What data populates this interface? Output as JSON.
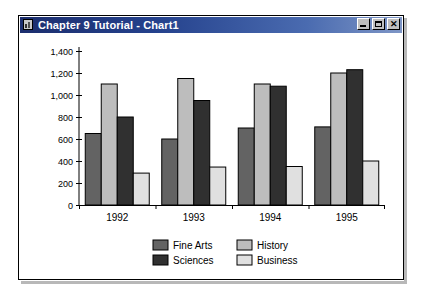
{
  "window": {
    "title": "Chapter 9 Tutorial - Chart1",
    "icon": "chart-document-icon",
    "buttons": {
      "minimize": "–",
      "maximize": "□",
      "close": "✕"
    }
  },
  "chart_data": {
    "type": "bar",
    "title": "",
    "xlabel": "",
    "ylabel": "",
    "categories": [
      "1992",
      "1993",
      "1994",
      "1995"
    ],
    "ylim": [
      0,
      1400
    ],
    "yticks": [
      0,
      200,
      400,
      600,
      800,
      1000,
      1200,
      1400
    ],
    "ytick_labels": [
      "0",
      "200",
      "400",
      "600",
      "800",
      "1,000",
      "1,200",
      "1,400"
    ],
    "grid": false,
    "legend_position": "bottom",
    "series": [
      {
        "name": "Fine Arts",
        "color": "#636363",
        "values": [
          650,
          600,
          700,
          710
        ]
      },
      {
        "name": "History",
        "color": "#bdbdbd",
        "values": [
          1100,
          1150,
          1100,
          1200
        ]
      },
      {
        "name": "Sciences",
        "color": "#303030",
        "values": [
          800,
          950,
          1080,
          1230
        ]
      },
      {
        "name": "Business",
        "color": "#e0e0e0",
        "values": [
          290,
          345,
          350,
          400
        ]
      }
    ],
    "legend_order": [
      "Fine Arts",
      "History",
      "Sciences",
      "Business"
    ]
  },
  "colors": {
    "titlebar_start": "#1c2e6e",
    "titlebar_end": "#7e96c6",
    "axis": "#000000",
    "plot_background": "#ffffff"
  }
}
